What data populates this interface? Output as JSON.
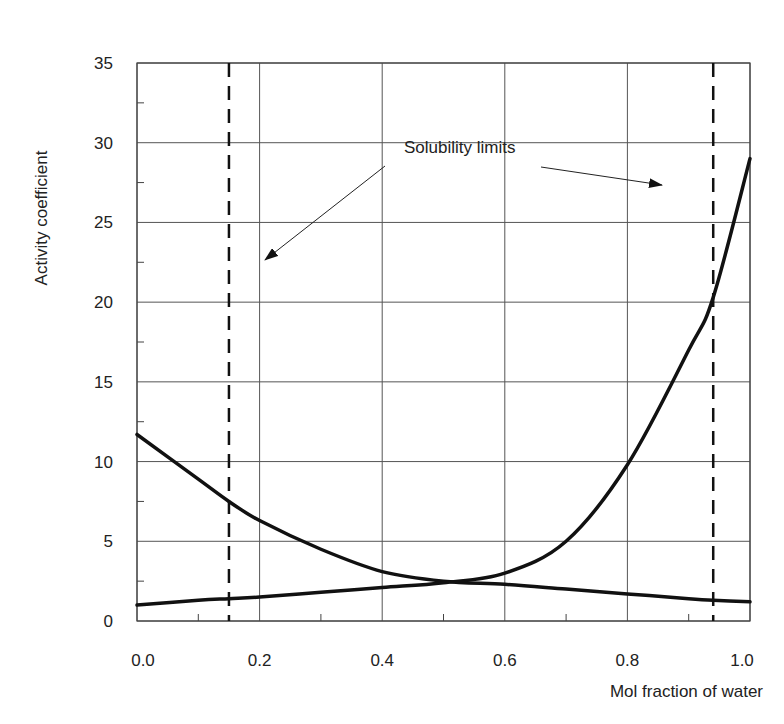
{
  "chart_data": {
    "type": "line",
    "title": "",
    "xlabel": "Mol fraction of water",
    "ylabel": "Activity coefficient",
    "xlim": [
      0.0,
      1.0
    ],
    "ylim": [
      0,
      35
    ],
    "x_ticks": [
      "0.0",
      "0.2",
      "0.4",
      "0.6",
      "0.8",
      "1.0"
    ],
    "y_ticks": [
      "0",
      "5",
      "10",
      "15",
      "20",
      "25",
      "30",
      "35"
    ],
    "grid": true,
    "legend": null,
    "x": [
      0.0,
      0.1,
      0.15,
      0.2,
      0.3,
      0.4,
      0.5,
      0.6,
      0.7,
      0.8,
      0.9,
      0.94,
      1.0
    ],
    "series": [
      {
        "name": "Activity coefficient (decreasing curve)",
        "values": [
          11.7,
          8.9,
          7.5,
          6.3,
          4.5,
          3.1,
          2.5,
          2.3,
          2.0,
          1.7,
          1.4,
          1.3,
          1.2
        ]
      },
      {
        "name": "Activity coefficient (increasing curve)",
        "values": [
          1.0,
          1.3,
          1.4,
          1.5,
          1.8,
          2.1,
          2.4,
          3.0,
          5.0,
          9.8,
          17.0,
          20.3,
          29.0
        ]
      }
    ],
    "reference_lines": [
      {
        "type": "vertical",
        "style": "dashed",
        "x": 0.15,
        "label": "Solubility limit"
      },
      {
        "type": "vertical",
        "style": "dashed",
        "x": 0.94,
        "label": "Solubility limit"
      }
    ],
    "annotations": [
      {
        "text": "Solubility limits",
        "x": 0.5,
        "y": 30.3,
        "arrows_to": [
          [
            0.2,
            22.5
          ],
          [
            0.83,
            28.0
          ]
        ]
      }
    ]
  },
  "labels": {
    "xlabel": "Mol fraction of water",
    "ylabel": "Activity coefficient",
    "annotation": "Solubility limits",
    "x_ticks": [
      "0.0",
      "0.2",
      "0.4",
      "0.6",
      "0.8",
      "1.0"
    ],
    "y_ticks": [
      "0",
      "5",
      "10",
      "15",
      "20",
      "25",
      "30",
      "35"
    ]
  }
}
